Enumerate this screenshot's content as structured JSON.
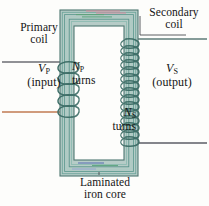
{
  "figure": {
    "width": 209,
    "height": 206
  },
  "labels": {
    "primary_coil_line1": "Primary",
    "primary_coil_line2": "coil",
    "secondary_coil_line1": "Secondary",
    "secondary_coil_line2": "coil",
    "vp_symbol": "V",
    "vp_subscript": "P",
    "vp_note": "(input)",
    "vs_symbol": "V",
    "vs_subscript": "S",
    "vs_note": "(output)",
    "np_symbol": "N",
    "np_subscript": "P",
    "np_word": "turns",
    "ns_symbol": "N",
    "ns_subscript": "S",
    "ns_word": "turns",
    "core_line1": "Laminated",
    "core_line2": "iron core"
  },
  "colors": {
    "core_fill": "#b9cfc9",
    "core_outline": "#5c7f78",
    "lamination_teal": "#4f8d84",
    "lamination_green": "#5fa37c",
    "lamination_pale": "#9fc4bb",
    "lamination_pink": "#d98a9c",
    "lamination_blue": "#4f6fb5",
    "lamination_orange": "#cf7a4e",
    "wire": "#3f6f68",
    "lead_gray": "#6f7176",
    "lead_dark": "#4a4c50",
    "text": "#141414",
    "background": "#fdfdfb"
  },
  "geometry": {
    "core_outer": {
      "x": 60,
      "y": 10,
      "width": 78,
      "height": 166
    },
    "core_window": {
      "x": 74,
      "y": 26,
      "width": 50,
      "height": 134
    },
    "lamination_count": 6,
    "primary_turns_drawn": 5,
    "secondary_turns_drawn": 16,
    "primary_limb": "left",
    "secondary_limb": "right"
  },
  "leads": {
    "primary_top_y": 62,
    "primary_bottom_y": 112,
    "secondary_top_y": 39,
    "secondary_bottom_y": 143
  }
}
